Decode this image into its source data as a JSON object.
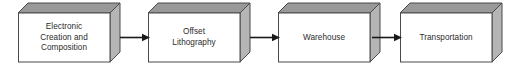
{
  "diagram": {
    "orientation": "left-to-right",
    "background_color": "#ffffff",
    "box_style": {
      "front_fill": "#ffffff",
      "top_fill": "#999999",
      "side_fill": "#b5b5b5",
      "stroke": "#4a4a4a",
      "text_color": "#2b2b2b",
      "depth_px": 10
    },
    "arrow_color": "#1a1a1a",
    "nodes": [
      {
        "id": "electronic-creation-and-composition",
        "label": "Electronic\nCreation and\nComposition",
        "lines": [
          "Electronic",
          "Creation and",
          "Composition"
        ],
        "x": 18,
        "y": 13
      },
      {
        "id": "offset-lithography",
        "label": "Offset\nLithography",
        "lines": [
          "Offset",
          "Lithography"
        ],
        "x": 148,
        "y": 13
      },
      {
        "id": "warehouse",
        "label": "Warehouse",
        "lines": [
          "Warehouse"
        ],
        "x": 278,
        "y": 13
      },
      {
        "id": "transportation",
        "label": "Transportation",
        "lines": [
          "Transportation"
        ],
        "x": 400,
        "y": 13
      }
    ],
    "connectors": [
      {
        "id": "arrow-1",
        "from": "electronic-creation-and-composition",
        "to": "offset-lithography",
        "x": 120,
        "width": 30
      },
      {
        "id": "arrow-2",
        "from": "offset-lithography",
        "to": "warehouse",
        "x": 250,
        "width": 30
      },
      {
        "id": "arrow-3",
        "from": "warehouse",
        "to": "transportation",
        "x": 372,
        "width": 30
      }
    ]
  }
}
